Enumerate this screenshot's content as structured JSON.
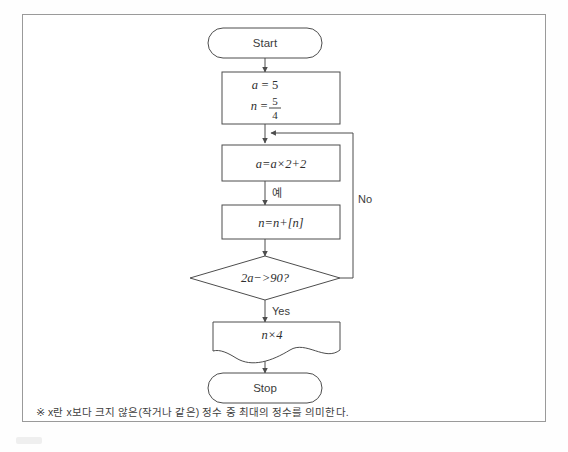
{
  "diagram": {
    "nodes": {
      "start": {
        "label": "Start",
        "shape": "terminator"
      },
      "init": {
        "shape": "process",
        "line1_lhs": "a",
        "line1_eq": "=",
        "line1_rhs": "5",
        "line2_lhs": "n",
        "line2_eq": "=",
        "line2_numerator": "5",
        "line2_denominator": "4"
      },
      "update_a": {
        "shape": "process",
        "text": "a=a×2+2"
      },
      "update_n": {
        "shape": "process",
        "text": "n=n+[n]"
      },
      "decision": {
        "shape": "decision",
        "text": "2a−>90?"
      },
      "output": {
        "shape": "document",
        "text": "n×4"
      },
      "stop": {
        "label": "Stop",
        "shape": "terminator"
      }
    },
    "edge_labels": {
      "yes_korean": "예",
      "no": "No",
      "yes": "Yes"
    }
  },
  "footnote": {
    "text": "※ x란 x보다 크지 않은(작거나 같은) 정수 중 최대의 정수를 의미한다."
  },
  "colors": {
    "stroke": "#4d4d4d",
    "frame": "#9a9a9a",
    "text": "#3b3b3b",
    "background": "#ffffff"
  }
}
